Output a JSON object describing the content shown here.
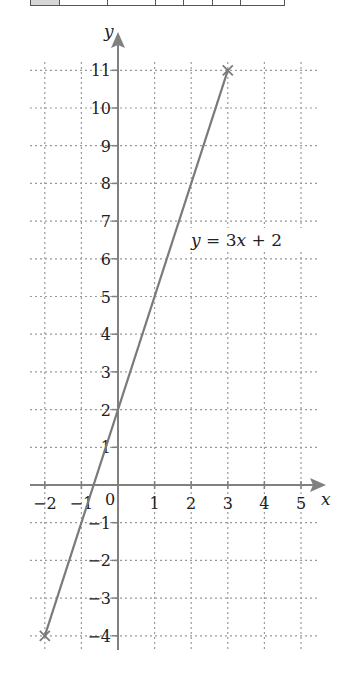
{
  "table_strip": {
    "cell_widths": [
      29,
      48,
      48,
      28,
      29,
      28,
      43
    ],
    "shaded_first": true
  },
  "chart_data": {
    "type": "line",
    "title": "",
    "xlabel": "x",
    "ylabel": "y",
    "xlim": [
      -2,
      5
    ],
    "ylim": [
      -4,
      11
    ],
    "grid": true,
    "grid_style": "dotted",
    "x_ticks": [
      -2,
      -1,
      0,
      1,
      2,
      3,
      4,
      5
    ],
    "y_ticks": [
      -4,
      -3,
      -2,
      -1,
      1,
      2,
      3,
      4,
      5,
      6,
      7,
      8,
      9,
      10,
      11
    ],
    "origin_label": "0",
    "series": [
      {
        "name": "y = 3x + 2",
        "equation": "y = 3x + 2",
        "slope": 3,
        "intercept": 2,
        "x": [
          -2,
          -1,
          0,
          1,
          2,
          3
        ],
        "y": [
          -4,
          -1,
          2,
          5,
          8,
          11
        ],
        "endpoints_marked": [
          [
            -2,
            -4
          ],
          [
            3,
            11
          ]
        ],
        "marker": "x",
        "color": "#7a7a7a"
      }
    ],
    "annotations": [
      {
        "text": "y = 3x + 2",
        "x": 2.6,
        "y": 6.5
      }
    ]
  },
  "colors": {
    "axis": "#808080",
    "grid": "#9a9a9a",
    "line": "#7a7a7a",
    "text": "#222222"
  },
  "labels": {
    "x_axis": "x",
    "y_axis": "y",
    "equation": "y = 3x + 2"
  }
}
